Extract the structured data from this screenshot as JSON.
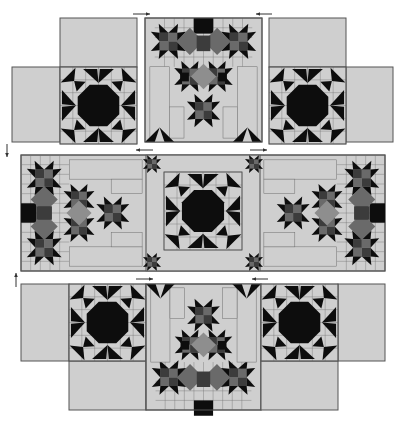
{
  "diagram": {
    "colors": {
      "background": "#ffffff",
      "light": "#cfcfcf",
      "seam": "#6e6e6e",
      "outline": "#555555",
      "black": "#0d0d0d",
      "dark": "#3c3c3c",
      "medium": "#6a6a6a",
      "mediumLight": "#8e8e8e",
      "arrow": "#333333"
    },
    "rows": [
      {
        "name": "top-row",
        "sections": [
          "left-sun-block-unit",
          "center-star-cluster-panel",
          "right-sun-block-unit"
        ]
      },
      {
        "name": "middle-row",
        "sections": [
          "left-star-cluster",
          "center-sun-block",
          "right-star-cluster"
        ]
      },
      {
        "name": "bottom-row",
        "sections": [
          "left-sun-block-unit",
          "center-star-cluster-panel",
          "right-sun-block-unit"
        ]
      }
    ],
    "pressing_arrows": [
      {
        "name": "arrow-top-left",
        "direction": "right"
      },
      {
        "name": "arrow-top-right",
        "direction": "left"
      },
      {
        "name": "arrow-row1-down",
        "direction": "down"
      },
      {
        "name": "arrow-middle-top-left",
        "direction": "left"
      },
      {
        "name": "arrow-middle-top-right",
        "direction": "right"
      },
      {
        "name": "arrow-row3-up",
        "direction": "up"
      },
      {
        "name": "arrow-bottom-left",
        "direction": "right"
      },
      {
        "name": "arrow-bottom-right",
        "direction": "left"
      }
    ]
  }
}
